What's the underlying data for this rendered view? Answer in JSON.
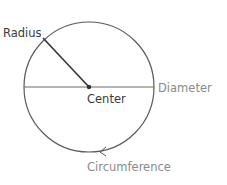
{
  "diagram": {
    "labels": {
      "radius": "Radius",
      "center": "Center",
      "diameter": "Diameter",
      "circumference": "Circumference"
    },
    "colors": {
      "stroke": "#555555",
      "radius_line": "#333333",
      "label_dark": "#3a3a3a",
      "label_gray": "#8a8a8a"
    },
    "geometry": {
      "center": [
        89,
        87
      ],
      "radius": 65
    }
  }
}
